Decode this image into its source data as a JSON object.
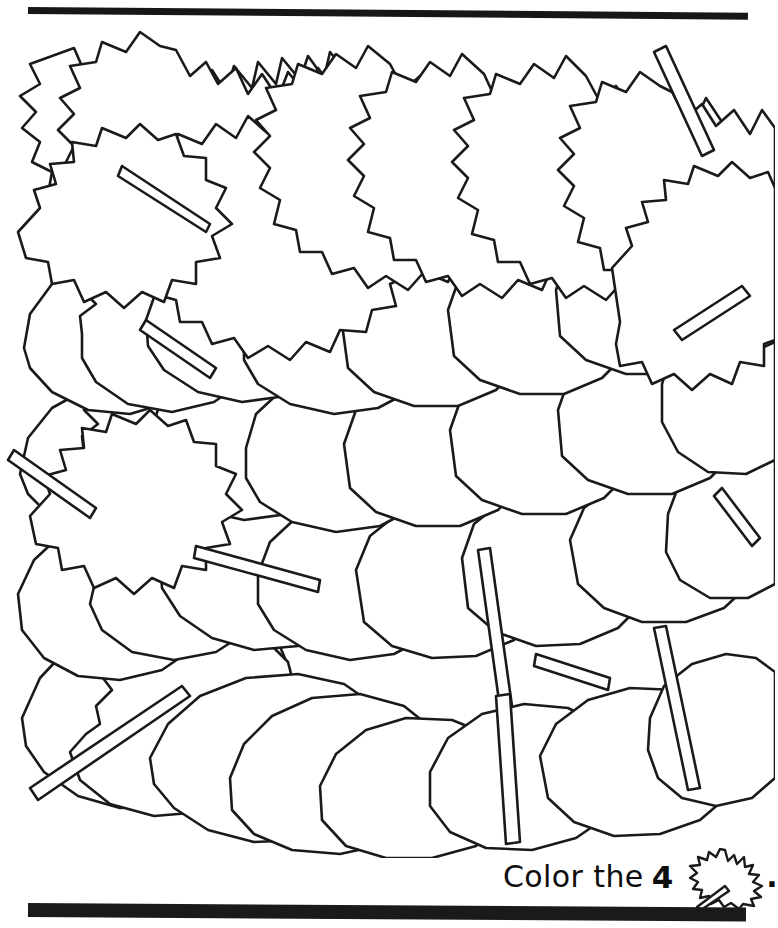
{
  "page": {
    "type": "coloring-worksheet",
    "background_color": "#ffffff",
    "ink_color": "#1a1a1a"
  },
  "rules": {
    "top_rule_color": "#171717",
    "bottom_rule_color": "#1a1a1a"
  },
  "artwork": {
    "name": "overlapping-leaves-pile",
    "description": "Dense pile of overlapping outlined autumn leaves",
    "stroke_color": "#1a1a1a",
    "fill_color": "#ffffff",
    "leaf_count_visible": 40
  },
  "caption": {
    "prefix": "Color the",
    "count": "4",
    "icon": "maple-leaf-icon",
    "suffix": "."
  }
}
